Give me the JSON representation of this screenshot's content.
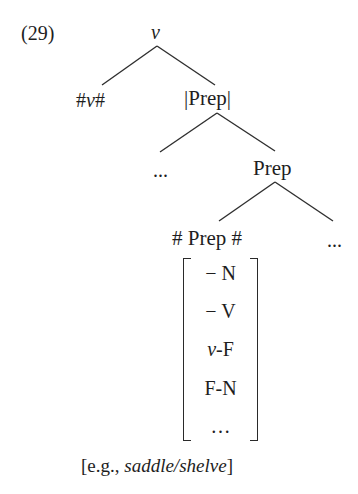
{
  "example_number": "(29)",
  "tree": {
    "root": {
      "label": "ν"
    },
    "root_left": {
      "label_hash_open": "#",
      "label_core": "ν",
      "label_hash_close": "#"
    },
    "root_right": {
      "label": "|Prep|"
    },
    "mid_left": {
      "label": "..."
    },
    "mid_right": {
      "label": "Prep"
    },
    "leaf_left": {
      "label": "# Prep #"
    },
    "leaf_right": {
      "label": "..."
    }
  },
  "feature_matrix": {
    "rows": [
      "− N",
      "− V",
      "ν-F",
      "F-N",
      "…"
    ]
  },
  "caption": {
    "open": "[e.g., ",
    "example": "saddle/shelve",
    "close": "]"
  }
}
